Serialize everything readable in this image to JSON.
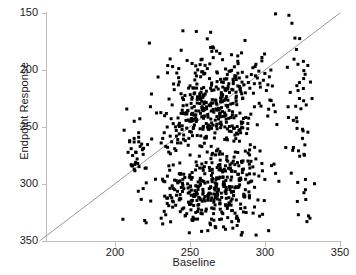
{
  "chart_data": {
    "type": "scatter",
    "title": "",
    "xlabel": "Baseline",
    "ylabel": "Endpoint Response",
    "xlim": [
      155,
      350
    ],
    "ylim": [
      150,
      350
    ],
    "xticks": [
      200,
      250,
      300,
      350
    ],
    "yticks": [
      150,
      200,
      250,
      300,
      350
    ],
    "grid": false,
    "legend": "none",
    "marker": {
      "shape": "square",
      "color": "#000000",
      "size_px": 3
    },
    "annotations": [
      {
        "kind": "reference-line",
        "label": "identity line y = x",
        "from": [
          150,
          150
        ],
        "to": [
          350,
          350
        ],
        "color": "#9a9a9a",
        "width_px": 1
      }
    ],
    "n_points": 880,
    "clusters": [
      {
        "name": "upper-responder-cluster",
        "x_center": 267,
        "y_center": 268,
        "x_sd": 17,
        "y_sd": 24,
        "n": 430
      },
      {
        "name": "lower-responder-cluster",
        "x_center": 266,
        "y_center": 193,
        "x_sd": 18,
        "y_sd": 19,
        "n": 380
      },
      {
        "name": "left-sparse-outliers",
        "x_center": 214,
        "y_center": 222,
        "x_sd": 5,
        "y_sd": 26,
        "n": 22
      },
      {
        "name": "right-sparse-outliers",
        "x_center": 322,
        "y_center": 255,
        "x_sd": 5,
        "y_sd": 52,
        "n": 48
      }
    ],
    "series": [
      {
        "name": "patients",
        "x": [
          210,
          210,
          211,
          212,
          213,
          214,
          215,
          216,
          217,
          218,
          219,
          220,
          221,
          221,
          213,
          214,
          216,
          211,
          212,
          219,
          231,
          232,
          233,
          234,
          235,
          236,
          237,
          238,
          239,
          240,
          241,
          242,
          243,
          244,
          245,
          246,
          247,
          248,
          249,
          250,
          231,
          233,
          235,
          237,
          239,
          241,
          243,
          245,
          247,
          249,
          232,
          234,
          236,
          238,
          240,
          242,
          244,
          246,
          248,
          250,
          251,
          252,
          253,
          254,
          255,
          256,
          257,
          258,
          259,
          260,
          261,
          262,
          263,
          264,
          265,
          266,
          267,
          268,
          269,
          270,
          251,
          253,
          255,
          257,
          259,
          261,
          263,
          265,
          267,
          269,
          252,
          254,
          256,
          258,
          260,
          262,
          264,
          266,
          268,
          270,
          271,
          272,
          273,
          274,
          275,
          276,
          277,
          278,
          279,
          280,
          281,
          282,
          283,
          284,
          285,
          286,
          287,
          288,
          289,
          290,
          271,
          273,
          275,
          277,
          279,
          281,
          283,
          285,
          287,
          289,
          272,
          274,
          276,
          278,
          280,
          282,
          284,
          286,
          288,
          290,
          291,
          292,
          293,
          294,
          295,
          296,
          297,
          298,
          299,
          300,
          301,
          302,
          303,
          304,
          305,
          292,
          294,
          296,
          298,
          300,
          316,
          318,
          320,
          321,
          322,
          323,
          324,
          325,
          326,
          327,
          328,
          329,
          330,
          319,
          321,
          323,
          325,
          327
        ],
        "y": [
          237,
          238,
          217,
          216,
          213,
          219,
          222,
          245,
          233,
          235,
          196,
          168,
          166,
          214,
          240,
          228,
          241,
          231,
          225,
          226,
          236,
          240,
          245,
          233,
          250,
          228,
          242,
          237,
          253,
          231,
          247,
          239,
          244,
          236,
          251,
          243,
          238,
          249,
          234,
          246,
          170,
          176,
          183,
          190,
          196,
          203,
          186,
          178,
          172,
          192,
          165,
          173,
          181,
          188,
          195,
          201,
          187,
          179,
          174,
          193,
          255,
          262,
          268,
          258,
          271,
          264,
          275,
          259,
          266,
          272,
          253,
          261,
          269,
          257,
          274,
          263,
          256,
          270,
          265,
          260,
          185,
          191,
          198,
          205,
          212,
          178,
          196,
          202,
          188,
          194,
          168,
          175,
          182,
          203,
          209,
          190,
          197,
          184,
          200,
          206,
          278,
          285,
          292,
          282,
          296,
          288,
          299,
          283,
          290,
          295,
          277,
          286,
          293,
          281,
          298,
          287,
          280,
          294,
          289,
          284,
          192,
          199,
          206,
          213,
          220,
          186,
          203,
          210,
          195,
          201,
          174,
          181,
          188,
          211,
          217,
          197,
          204,
          191,
          208,
          214,
          296,
          302,
          288,
          305,
          293,
          299,
          285,
          308,
          291,
          297,
          282,
          287,
          294,
          300,
          286,
          215,
          222,
          207,
          218,
          204,
          348,
          341,
          328,
          318,
          305,
          289,
          266,
          248,
          226,
          204,
          167,
          172,
          170,
          232,
          258,
          275,
          240,
          195
        ]
      }
    ]
  },
  "axes": {
    "y_tick_labels": [
      "350",
      "300",
      "250",
      "200",
      "150"
    ],
    "x_tick_labels": [
      "200",
      "250",
      "300",
      "350"
    ],
    "y_axis_title": "Endpoint Response",
    "x_axis_title": "Baseline"
  },
  "colors": {
    "marker": "#000000",
    "axis": "#bdbdbd",
    "reference_line": "#9a9a9a",
    "text": "#1a1a1a",
    "background": "#ffffff"
  }
}
